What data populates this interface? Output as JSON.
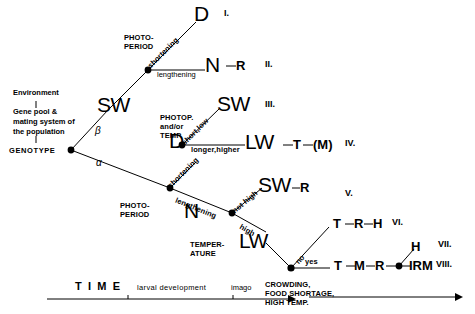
{
  "diagram": {
    "title_hidden": "",
    "left_block": {
      "environment": "Environment",
      "gene_pool_line1": "Gene pool &",
      "gene_pool_line2": "mating system of",
      "gene_pool_line3": "the population",
      "genotype": "GENOTYPE"
    },
    "greek": {
      "beta": "β",
      "alpha": "α"
    },
    "factors": {
      "photoperiod_top_l1": "PHOTO-",
      "photoperiod_top_l2": "PERIOD",
      "photop_temp_l1": "PHOTOP.",
      "photop_temp_l2": "and/or",
      "photop_temp_l3": "TEMP.",
      "photoperiod_mid_l1": "PHOTO-",
      "photoperiod_mid_l2": "PERIOD",
      "temperature_l1": "TEMPER-",
      "temperature_l2": "ATURE"
    },
    "edge_labels": {
      "shortening_top": "shortening",
      "lengthening_top": "lengthening",
      "short_low": "short,low",
      "longer_higher": "longer,higher",
      "shortening_mid": "shortening",
      "lengthening_mid": "lengthening",
      "not_high": "not high",
      "high": "high",
      "no": "no",
      "yes": "yes"
    },
    "outcomes": {
      "D_top": "D",
      "SW_left": "SW",
      "N_top": "N",
      "R_after_N": "R",
      "SW_III": "SW",
      "D_mid": "D",
      "LW_IV": "LW",
      "T_after_LW": "T",
      "M_after_T": "(M)",
      "N_mid": "N",
      "SW_V": "SW",
      "R_after_SW_V": "R",
      "LW_bottom": "LW",
      "T_VI": "T",
      "R_VI": "R",
      "H_VI": "H",
      "T_VIII": "T",
      "M_VIII": "M",
      "R_VIII": "R",
      "IRM_VIII": "IRM",
      "H_VII": "H"
    },
    "romans": {
      "i": "I.",
      "ii": "II.",
      "iii": "III.",
      "iv": "IV.",
      "v": "V.",
      "vi": "VI.",
      "vii": "VII.",
      "viii": "VIII."
    },
    "timeline": {
      "time": "T I M E",
      "larval_development": "larval development",
      "imago": "imago",
      "stress_l1": "CROWDING,",
      "stress_l2": "FOOD SHORTAGE,",
      "stress_l3": "HIGH TEMP."
    },
    "colors": {
      "ink": "#000000",
      "background": "#ffffff"
    }
  }
}
